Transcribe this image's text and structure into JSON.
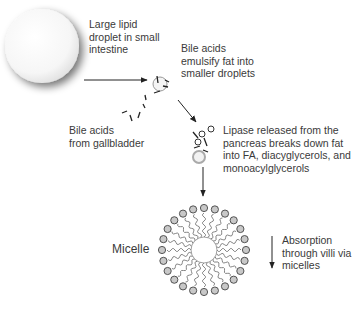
{
  "diagram": {
    "labels": {
      "large_droplet": "Large lipid\ndroplet in small\nintestine",
      "emulsify": "Bile acids\nemulsify fat into\nsmaller droplets",
      "bile_source": "Bile acids\nfrom gallbladder",
      "lipase": "Lipase released from the\npancreas breaks down fat\ninto FA, diacyglycerols, and\nmonoacylglycerols",
      "micelle": "Micelle",
      "absorption": "Absorption\nthrough villi via\nmicelles"
    },
    "steps": [
      {
        "id": "large-droplet",
        "description": "Large lipid droplet in small intestine"
      },
      {
        "id": "emulsification",
        "description": "Bile acids emulsify fat into smaller droplets"
      },
      {
        "id": "lipase-digestion",
        "description": "Lipase released from the pancreas breaks down fat into FA, diacyglycerols, and monoacylglycerols"
      },
      {
        "id": "micelle",
        "description": "Micelle"
      },
      {
        "id": "absorption",
        "description": "Absorption through villi via micelles"
      }
    ],
    "colors": {
      "line": "#222222",
      "droplet_fill": "#f7f7f7",
      "droplet_shadow": "#8a8a8a",
      "head_fill": "#c8c8c8",
      "head_stroke": "#444444",
      "tail": "#666666",
      "text": "#3a3a3a"
    }
  }
}
